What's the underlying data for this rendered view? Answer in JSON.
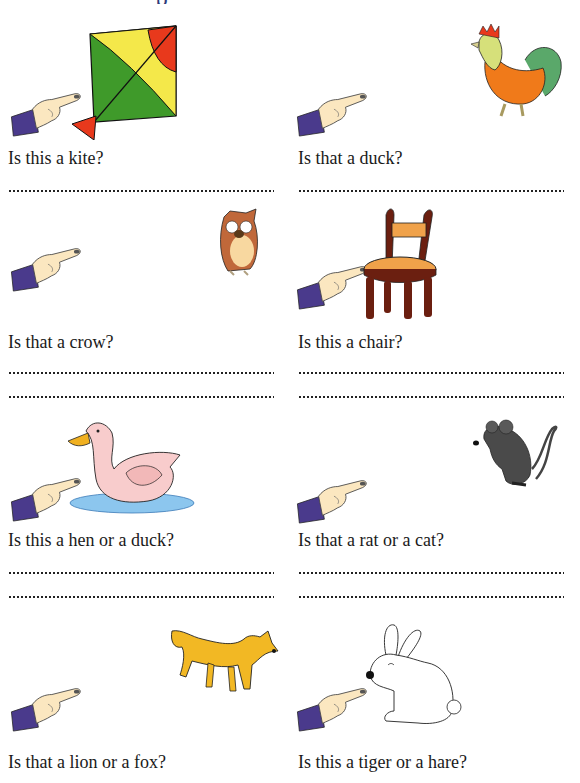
{
  "worksheet": {
    "exercises": [
      {
        "question": "Is this a kite?",
        "picture": "kite",
        "answer_lines": 1
      },
      {
        "question": "Is that a duck?",
        "picture": "rooster",
        "answer_lines": 1
      },
      {
        "question": "Is that a crow?",
        "picture": "owl",
        "answer_lines": 2
      },
      {
        "question": "Is this a chair?",
        "picture": "chair",
        "answer_lines": 2
      },
      {
        "question": "Is this a hen or a duck?",
        "picture": "duck",
        "answer_lines": 2
      },
      {
        "question": "Is that a rat or a cat?",
        "picture": "rat",
        "answer_lines": 2
      },
      {
        "question": "Is that a lion or a fox?",
        "picture": "fox",
        "answer_lines": 0
      },
      {
        "question": "Is this a tiger or a hare?",
        "picture": "hare",
        "answer_lines": 0
      }
    ]
  },
  "colors": {
    "sleeve": "#4a3a8c",
    "skin": "#fbe7c0",
    "kite_green": "#3f9a2a",
    "kite_yellow": "#f4e84a",
    "kite_red": "#e8391c",
    "chair_wood": "#6b1f10",
    "chair_seat": "#f0a24a",
    "fox": "#f2b824",
    "rat": "#4a4a4a",
    "water": "#8cc6ee"
  }
}
